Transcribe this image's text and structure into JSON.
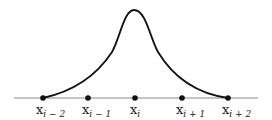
{
  "diagram": {
    "type": "basis-function-plot",
    "axis": {
      "x1": 14,
      "x2": 258,
      "y": 98,
      "color": "#888888"
    },
    "curve": {
      "color": "#111111",
      "peak": {
        "x": 134,
        "y": 10
      }
    },
    "nodes": [
      {
        "id": "x_i-2",
        "var": "x",
        "sub": "i − 2",
        "x": 43
      },
      {
        "id": "x_i-1",
        "var": "x",
        "sub": "i − 1",
        "x": 88
      },
      {
        "id": "x_i",
        "var": "x",
        "sub": "i",
        "x": 135
      },
      {
        "id": "x_i+1",
        "var": "x",
        "sub": "i + 1",
        "x": 182
      },
      {
        "id": "x_i+2",
        "var": "x",
        "sub": "i + 2",
        "x": 228
      }
    ]
  }
}
